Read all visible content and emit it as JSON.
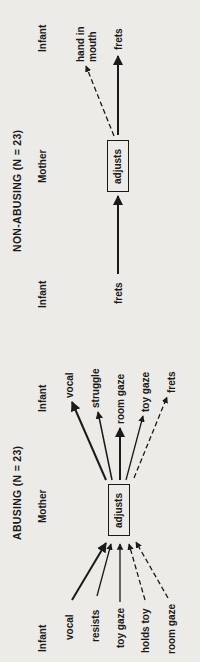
{
  "abusing": {
    "title": "ABUSING (N = 23)",
    "mother_label": "Mother",
    "center_node": "adjusts",
    "infant_before_header": "Infant",
    "infant_after_header": "Infant",
    "antecedents": [
      {
        "label": "vocal",
        "style": "solid-thick"
      },
      {
        "label": "resists",
        "style": "solid"
      },
      {
        "label": "toy gaze",
        "style": "solid"
      },
      {
        "label": "holds toy",
        "style": "dashed"
      },
      {
        "label": "room gaze",
        "style": "dashed"
      }
    ],
    "consequents": [
      {
        "label": "vocal",
        "style": "solid-thick"
      },
      {
        "label": "struggle",
        "style": "solid"
      },
      {
        "label": "room gaze",
        "style": "solid-thick"
      },
      {
        "label": "toy gaze",
        "style": "solid"
      },
      {
        "label": "frets",
        "style": "dashed"
      }
    ]
  },
  "non_abusing": {
    "title": "NON-ABUSING (N = 23)",
    "mother_label": "Mother",
    "center_node": "adjusts",
    "infant_before_header": "Infant",
    "infant_after_header": "Infant",
    "antecedents": [
      {
        "label": "frets",
        "style": "solid-thick"
      }
    ],
    "consequents": [
      {
        "label": "hand in",
        "label2": "mouth",
        "style": "dashed"
      },
      {
        "label": "frets",
        "style": "solid-thick"
      }
    ]
  }
}
